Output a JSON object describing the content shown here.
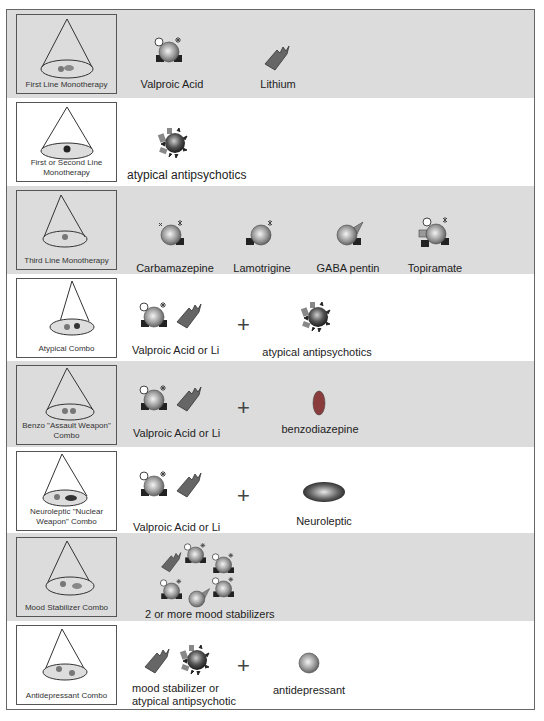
{
  "colors": {
    "row_gray": "#dcdcdc",
    "row_white": "#ffffff",
    "frame": "#666666",
    "lithium": "#666666",
    "benzo": "#8a3b3b"
  },
  "rows": [
    {
      "tile_label": "First Line Monotherapy",
      "items": [
        {
          "icon": "valproic-acid-icon",
          "label": "Valproic Acid"
        },
        {
          "icon": "lithium-icon",
          "label": "Lithium"
        }
      ]
    },
    {
      "tile_label": "First or Second Line Monotherapy",
      "items": [
        {
          "icon": "atypical-antipsychotic-icon",
          "label": "atypical antipsychotics"
        }
      ]
    },
    {
      "tile_label": "Third Line Monotherapy",
      "items": [
        {
          "icon": "carbamazepine-icon",
          "label": "Carbamazepine"
        },
        {
          "icon": "lamotrigine-icon",
          "label": "Lamotrigine"
        },
        {
          "icon": "gabapentin-icon",
          "label": "GABA pentin"
        },
        {
          "icon": "topiramate-icon",
          "label": "Topiramate"
        }
      ]
    },
    {
      "tile_label": "Atypical Combo",
      "items": [
        {
          "icon": "valproic-or-lithium-icon",
          "label": "Valproic Acid or Li"
        },
        {
          "icon": "atypical-antipsychotic-icon",
          "label": "atypical antipsychotics"
        }
      ],
      "plus": "+"
    },
    {
      "tile_label": "Benzo \"Assault Weapon\" Combo",
      "items": [
        {
          "icon": "valproic-or-lithium-icon",
          "label": "Valproic Acid or Li"
        },
        {
          "icon": "benzodiazepine-icon",
          "label": "benzodiazepine"
        }
      ],
      "plus": "+"
    },
    {
      "tile_label": "Neuroleptic \"Nuclear Weapon\" Combo",
      "items": [
        {
          "icon": "valproic-or-lithium-icon",
          "label": "Valproic Acid or Li"
        },
        {
          "icon": "neuroleptic-icon",
          "label": "Neuroleptic"
        }
      ],
      "plus": "+"
    },
    {
      "tile_label": "Mood Stabilizer Combo",
      "items": [
        {
          "icon": "mood-stabilizer-cluster-icon",
          "label": "2 or more mood stabilizers"
        }
      ]
    },
    {
      "tile_label": "Antidepressant Combo",
      "items": [
        {
          "icon": "mood-stabilizer-or-atypical-icon",
          "label": "mood stabilizer or atypical antipsychotic"
        },
        {
          "icon": "antidepressant-icon",
          "label": "antidepressant"
        }
      ],
      "plus": "+"
    }
  ]
}
